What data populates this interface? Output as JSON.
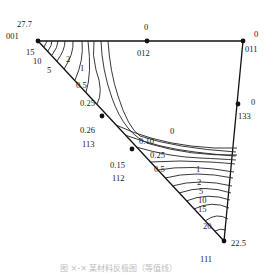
{
  "figure": {
    "type": "inverse-pole-figure-contour",
    "caption": "图 ×-×  某材料反极图（等值线）",
    "vertices": {
      "v001": {
        "index": "001",
        "value": "27.7"
      },
      "v011": {
        "index": "011",
        "value": "0"
      },
      "v111": {
        "index": "111",
        "value": "22.5"
      }
    },
    "edge_points": {
      "p012": {
        "index": "012",
        "value": "0"
      },
      "p133": {
        "index": "133",
        "value": "0"
      },
      "p113": {
        "index": "113",
        "value": "0.26"
      },
      "p112": {
        "index": "112",
        "value": "0.15"
      }
    },
    "contour_labels_001": [
      "15",
      "10",
      "5",
      "2",
      "1",
      "0.5",
      "0.25"
    ],
    "contour_labels_111": [
      "0",
      "0.10",
      "0.25",
      "0.5",
      "1",
      "2",
      "5",
      "10",
      "15",
      "20"
    ]
  }
}
